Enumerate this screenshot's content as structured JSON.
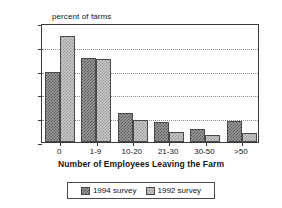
{
  "chart_data": {
    "type": "bar",
    "title": "",
    "ylabel": "percent of farms",
    "xlabel": "Number of Employees Leaving the Farm",
    "categories": [
      "0",
      "1-9",
      "10-20",
      "21-30",
      "30-50",
      ">50"
    ],
    "series": [
      {
        "name": "1994 survey",
        "values": [
          29.5,
          35.5,
          12.3,
          8.2,
          5.6,
          9.0
        ],
        "color": "#9a9a9a"
      },
      {
        "name": "1992 survey",
        "values": [
          44.6,
          34.8,
          9.2,
          4.4,
          3.1,
          3.6
        ],
        "color": "#c9c9c9"
      }
    ],
    "ylim": [
      0,
      50
    ],
    "yticks": [
      0,
      10,
      20,
      30,
      40,
      50
    ],
    "grid": true,
    "legend_position": "bottom"
  },
  "axes": {
    "y_title": "percent of farms",
    "x_title": "Number of Employees Leaving the Farm",
    "y_tick_labels": [
      "0",
      "10",
      "20",
      "30",
      "40",
      "50"
    ],
    "x_tick_labels": [
      "0",
      "1-9",
      "10-20",
      "21-30",
      "30-50",
      ">50"
    ]
  },
  "legend": {
    "entries": [
      {
        "label": "1994 survey",
        "swatch": "dark-hatch-swatch"
      },
      {
        "label": "1992 survey",
        "swatch": "light-hatch-swatch"
      }
    ]
  }
}
